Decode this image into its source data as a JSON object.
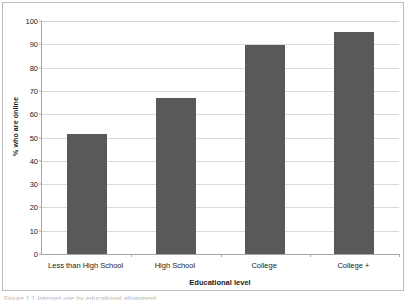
{
  "figure": {
    "caption_sliver": "Figure 1.1 Internet use by educational attainment"
  },
  "chart_data": {
    "type": "bar",
    "title": "",
    "categories": [
      "Less than High School",
      "High School",
      "College",
      "College +"
    ],
    "values": [
      51.5,
      66.8,
      89.5,
      95.3
    ],
    "xlabel": "Educational level",
    "ylabel": "% who are online",
    "ylim": [
      0,
      100
    ],
    "yticks": [
      0,
      10,
      20,
      30,
      40,
      50,
      60,
      70,
      80,
      90,
      100
    ],
    "ytick_labels": [
      "0",
      "10",
      "20",
      "30",
      "40",
      "50",
      "60",
      "70",
      "80",
      "90",
      "100"
    ],
    "grid": true,
    "legend": false,
    "bar_color": "#595959",
    "gridline_color": "#d9d9d9",
    "axis_color": "#a6a6a6",
    "background_color": "#ffffff"
  }
}
